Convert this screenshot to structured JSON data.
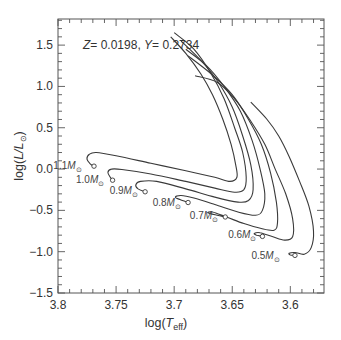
{
  "chart_data": {
    "type": "line",
    "title": "",
    "annotation": "Z = 0.0198, Y = 0.2734",
    "annotation_parts": {
      "z_sym": "Z",
      "z_val": "= 0.0198, ",
      "y_sym": "Y",
      "y_val": "= 0.2734"
    },
    "xlabel": "log(T_eff)",
    "xlabel_parts": {
      "pre": "log(",
      "sym": "T",
      "sub": "eff",
      "post": ")"
    },
    "ylabel": "log(L/L_sun)",
    "ylabel_parts": {
      "pre": "log(",
      "sym": "L/L",
      "sub": "⊙",
      "post": ")"
    },
    "xlim": [
      3.8,
      3.571
    ],
    "ylim": [
      -1.5,
      1.816
    ],
    "x_reversed": true,
    "xticks": [
      3.8,
      3.75,
      3.7,
      3.65,
      3.6
    ],
    "xtick_labels": [
      "3.8",
      "3.75",
      "3.7",
      "3.65",
      "3.6"
    ],
    "yticks": [
      1.5,
      1.0,
      0.5,
      0.0,
      -0.5,
      -1.0,
      -1.5
    ],
    "ytick_labels": [
      "1.5",
      "1.0",
      "0.5",
      "0.0",
      "−0.5",
      "−1.0",
      "−1.5"
    ],
    "x_minor_step": 0.01,
    "y_minor_step": 0.1,
    "grid": false,
    "legend": null,
    "series": [
      {
        "name": "1.1 M☉",
        "mass": "1.1",
        "label_pos": [
          3.7745,
          0.035
        ],
        "zams": [
          3.769,
          0.035
        ],
        "points": [
          [
            3.769,
            0.035
          ],
          [
            3.772,
            0.06
          ],
          [
            3.775,
            0.12
          ],
          [
            3.773,
            0.18
          ],
          [
            3.767,
            0.2
          ],
          [
            3.75,
            0.16
          ],
          [
            3.72,
            0.07
          ],
          [
            3.69,
            -0.02
          ],
          [
            3.665,
            -0.1
          ],
          [
            3.652,
            -0.15
          ],
          [
            3.646,
            -0.1
          ],
          [
            3.647,
            0.05
          ],
          [
            3.651,
            0.3
          ],
          [
            3.658,
            0.6
          ],
          [
            3.667,
            0.9
          ],
          [
            3.677,
            1.15
          ],
          [
            3.69,
            1.4
          ],
          [
            3.703,
            1.6
          ]
        ]
      },
      {
        "name": "1.0 M☉",
        "mass": "1.0",
        "label_pos": [
          3.755,
          -0.13
        ],
        "zams": [
          3.753,
          -0.135
        ],
        "points": [
          [
            3.753,
            -0.135
          ],
          [
            3.755,
            -0.1
          ],
          [
            3.757,
            -0.04
          ],
          [
            3.754,
            0.0
          ],
          [
            3.745,
            -0.005
          ],
          [
            3.72,
            -0.06
          ],
          [
            3.69,
            -0.15
          ],
          [
            3.665,
            -0.23
          ],
          [
            3.648,
            -0.28
          ],
          [
            3.64,
            -0.25
          ],
          [
            3.638,
            -0.1
          ],
          [
            3.641,
            0.2
          ],
          [
            3.648,
            0.5
          ],
          [
            3.657,
            0.85
          ],
          [
            3.668,
            1.15
          ],
          [
            3.683,
            1.45
          ],
          [
            3.7,
            1.65
          ]
        ]
      },
      {
        "name": "0.9 M☉",
        "mass": "0.9",
        "label_pos": [
          3.726,
          -0.27
        ],
        "zams": [
          3.725,
          -0.275
        ],
        "points": [
          [
            3.725,
            -0.275
          ],
          [
            3.731,
            -0.24
          ],
          [
            3.733,
            -0.19
          ],
          [
            3.729,
            -0.15
          ],
          [
            3.715,
            -0.15
          ],
          [
            3.69,
            -0.24
          ],
          [
            3.665,
            -0.34
          ],
          [
            3.645,
            -0.4
          ],
          [
            3.636,
            -0.38
          ],
          [
            3.632,
            -0.25
          ],
          [
            3.634,
            0.05
          ],
          [
            3.641,
            0.4
          ],
          [
            3.65,
            0.75
          ],
          [
            3.662,
            1.05
          ],
          [
            3.676,
            1.3
          ],
          [
            3.694,
            1.55
          ]
        ]
      },
      {
        "name": "0.8 M☉",
        "mass": "0.8",
        "label_pos": [
          3.689,
          -0.41
        ],
        "zams": [
          3.688,
          -0.405
        ],
        "points": [
          [
            3.688,
            -0.405
          ],
          [
            3.695,
            -0.37
          ],
          [
            3.699,
            -0.34
          ],
          [
            3.694,
            -0.32
          ],
          [
            3.683,
            -0.35
          ],
          [
            3.665,
            -0.43
          ],
          [
            3.645,
            -0.52
          ],
          [
            3.63,
            -0.56
          ],
          [
            3.624,
            -0.5
          ],
          [
            3.622,
            -0.3
          ],
          [
            3.626,
            0.0
          ],
          [
            3.633,
            0.35
          ],
          [
            3.643,
            0.7
          ],
          [
            3.657,
            1.0
          ],
          [
            3.672,
            1.25
          ],
          [
            3.69,
            1.45
          ]
        ]
      },
      {
        "name": "0.7 M☉",
        "mass": "0.7",
        "label_pos": [
          3.657,
          -0.57
        ],
        "zams": [
          3.656,
          -0.58
        ],
        "points": [
          [
            3.656,
            -0.58
          ],
          [
            3.663,
            -0.56
          ],
          [
            3.671,
            -0.53
          ],
          [
            3.667,
            -0.52
          ],
          [
            3.655,
            -0.58
          ],
          [
            3.64,
            -0.66
          ],
          [
            3.625,
            -0.72
          ],
          [
            3.614,
            -0.74
          ],
          [
            3.611,
            -0.65
          ],
          [
            3.612,
            -0.4
          ],
          [
            3.617,
            -0.05
          ],
          [
            3.625,
            0.3
          ],
          [
            3.636,
            0.6
          ],
          [
            3.65,
            0.9
          ],
          [
            3.668,
            1.15
          ],
          [
            3.688,
            1.37
          ]
        ]
      },
      {
        "name": "0.6 M☉",
        "mass": "0.6",
        "label_pos": [
          3.624,
          -0.8
        ],
        "zams": [
          3.624,
          -0.815
        ],
        "points": [
          [
            3.624,
            -0.815
          ],
          [
            3.629,
            -0.8
          ],
          [
            3.631,
            -0.78
          ],
          [
            3.626,
            -0.77
          ],
          [
            3.615,
            -0.82
          ],
          [
            3.605,
            -0.86
          ],
          [
            3.598,
            -0.82
          ],
          [
            3.598,
            -0.6
          ],
          [
            3.604,
            -0.3
          ],
          [
            3.613,
            0.0
          ],
          [
            3.622,
            0.3
          ],
          [
            3.635,
            0.6
          ],
          [
            3.648,
            0.85
          ],
          [
            3.663,
            1.05
          ],
          [
            3.682,
            1.13
          ]
        ]
      },
      {
        "name": "0.5 M☉",
        "mass": "0.5",
        "label_pos": [
          3.604,
          -1.05
        ],
        "zams": [
          3.596,
          -1.045
        ],
        "points": [
          [
            3.596,
            -1.045
          ],
          [
            3.6,
            -1.04
          ],
          [
            3.601,
            -1.02
          ],
          [
            3.596,
            -1.01
          ],
          [
            3.588,
            -1.03
          ],
          [
            3.582,
            -0.95
          ],
          [
            3.58,
            -0.75
          ],
          [
            3.584,
            -0.45
          ],
          [
            3.592,
            -0.15
          ],
          [
            3.601,
            0.15
          ],
          [
            3.61,
            0.4
          ],
          [
            3.62,
            0.6
          ],
          [
            3.634,
            0.81
          ]
        ]
      }
    ]
  }
}
